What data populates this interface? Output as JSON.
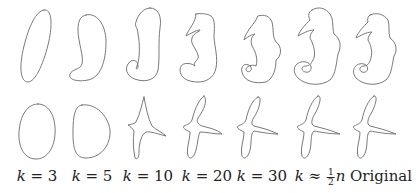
{
  "figure": {
    "rows": [
      {
        "name": "seahorse",
        "description": "Fourier approximation of seahorse contour"
      },
      {
        "name": "bird",
        "description": "Fourier approximation of bird contour"
      }
    ],
    "columns": [
      {
        "var": "k",
        "op": " = ",
        "value": "3"
      },
      {
        "var": "k",
        "op": " = ",
        "value": "5"
      },
      {
        "var": "k",
        "op": " = ",
        "value": "10"
      },
      {
        "var": "k",
        "op": " = ",
        "value": "20"
      },
      {
        "var": "k",
        "op": " = ",
        "value": "30"
      },
      {
        "var": "k",
        "op": " ≈ ",
        "frac_num": "1",
        "frac_den": "2",
        "tail": "n"
      },
      {
        "text": "Original"
      }
    ],
    "stroke_color": "#6a6a6a",
    "text_color": "#222222"
  }
}
